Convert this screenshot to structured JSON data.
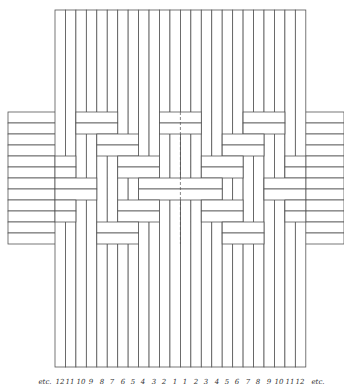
{
  "diagram": {
    "stroke_color": "#555555",
    "fill_color": "#ffffff",
    "vertical_strips": {
      "count": 24,
      "x_start": 55,
      "width": 10.45,
      "y_top": 10,
      "y_bottom": 367
    },
    "horizontal_strips": {
      "count": 12,
      "y_start": 112,
      "height": 11,
      "x_left": 8,
      "x_right": 344
    },
    "over_block_width_cols": 4,
    "pair_over_start_cols_right": [
      18,
      16,
      14,
      12,
      14,
      16
    ],
    "pattern_note": "Pairs of horizontal strips pass over four vertical strips then under four; the left half mirrors the right half about the center."
  },
  "labels": {
    "left_etc": "etc.",
    "left_numbers": [
      "12",
      "11",
      "10",
      "9",
      "8",
      "7",
      "6",
      "5",
      "4",
      "3",
      "2",
      "1"
    ],
    "right_numbers": [
      "1",
      "2",
      "3",
      "4",
      "5",
      "6",
      "7",
      "8",
      "9",
      "10",
      "11",
      "12"
    ],
    "right_etc": "etc."
  }
}
